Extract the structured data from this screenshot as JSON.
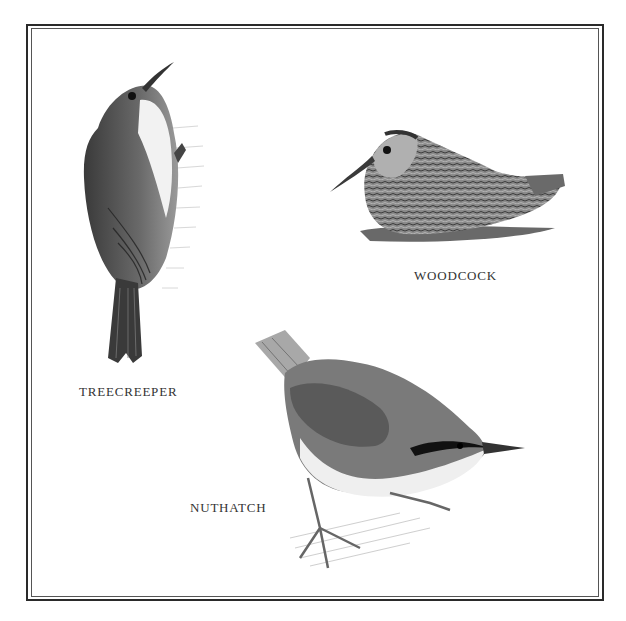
{
  "plate": {
    "birds": [
      {
        "id": "treecreeper",
        "label": "TREECREEPER"
      },
      {
        "id": "woodcock",
        "label": "WOODCOCK"
      },
      {
        "id": "nuthatch",
        "label": "NUTHATCH"
      }
    ]
  }
}
